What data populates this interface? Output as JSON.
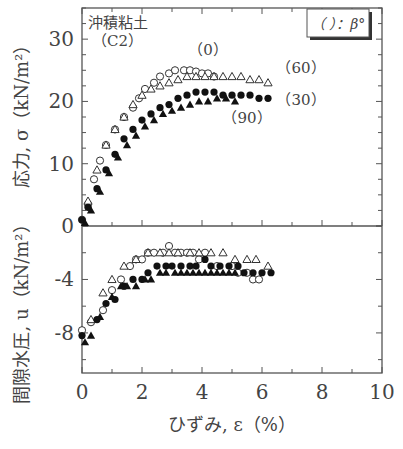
{
  "chart_data": [
    {
      "type": "scatter",
      "panel": "top",
      "title": "",
      "annotation_top_left": [
        "沖積粘土",
        "（C2）"
      ],
      "legend_box": "（ ）：β°",
      "xlabel": "ひずみ, ε（%）",
      "ylabel": "応力, σ（kN/m²）",
      "xlim": [
        0,
        10
      ],
      "ylim": [
        0,
        35
      ],
      "yticks": [
        0,
        10,
        20,
        30
      ],
      "series": [
        {
          "name": "(0)",
          "marker": "open-circle",
          "x": [
            0,
            0.2,
            0.4,
            0.6,
            0.8,
            1.1,
            1.4,
            1.7,
            1.9,
            2.1,
            2.4,
            2.6,
            2.9,
            3.1,
            3.4,
            3.6,
            3.8,
            4.0,
            4.2,
            4.4
          ],
          "y": [
            1.0,
            3.5,
            7.5,
            10.5,
            13.0,
            15.5,
            17.5,
            19.0,
            20.5,
            22.0,
            23.0,
            24.0,
            24.5,
            25.0,
            25.0,
            25.0,
            24.8,
            24.5,
            24.5,
            24.0
          ]
        },
        {
          "name": "(60)",
          "marker": "open-triangle",
          "x": [
            0.2,
            0.5,
            0.8,
            1.1,
            1.4,
            1.7,
            2.0,
            2.3,
            2.6,
            2.9,
            3.2,
            3.5,
            3.8,
            4.1,
            4.4,
            4.7,
            5.0,
            5.3,
            5.6,
            5.9,
            6.2
          ],
          "y": [
            4.0,
            9.0,
            13.0,
            15.5,
            17.5,
            19.5,
            21.0,
            22.0,
            22.5,
            23.0,
            23.5,
            24.0,
            24.0,
            24.0,
            24.0,
            24.0,
            24.0,
            24.0,
            23.5,
            23.5,
            23.0
          ]
        },
        {
          "name": "(30)",
          "marker": "filled-circle",
          "x": [
            0,
            0.2,
            0.5,
            0.8,
            1.1,
            1.4,
            1.7,
            2.0,
            2.3,
            2.6,
            2.9,
            3.2,
            3.5,
            3.8,
            4.1,
            4.4,
            4.7,
            5.0,
            5.3,
            5.6,
            5.9,
            6.2
          ],
          "y": [
            1.0,
            3.0,
            6.0,
            9.0,
            11.5,
            14.0,
            15.5,
            17.0,
            18.0,
            19.0,
            19.5,
            20.5,
            21.0,
            21.5,
            21.5,
            21.5,
            21.0,
            21.0,
            21.0,
            21.0,
            20.5,
            20.5
          ]
        },
        {
          "name": "(90)",
          "marker": "filled-triangle",
          "x": [
            0.1,
            0.3,
            0.6,
            0.9,
            1.2,
            1.5,
            1.8,
            2.1,
            2.4,
            2.7,
            3.0,
            3.3,
            3.6,
            3.9,
            4.2,
            4.5,
            4.8,
            5.1
          ],
          "y": [
            0.5,
            2.5,
            5.5,
            8.5,
            11.0,
            13.0,
            14.5,
            16.0,
            17.0,
            18.0,
            18.5,
            19.0,
            19.5,
            20.0,
            20.0,
            20.5,
            20.5,
            20.0
          ]
        }
      ],
      "series_labels": [
        {
          "text": "（0）",
          "x": 4.2,
          "y": 27.5
        },
        {
          "text": "（60）",
          "x": 7.3,
          "y": 24.5
        },
        {
          "text": "（30）",
          "x": 7.3,
          "y": 19.5
        },
        {
          "text": "（90）",
          "x": 5.5,
          "y": 16.5
        }
      ]
    },
    {
      "type": "scatter",
      "panel": "bottom",
      "xlabel": "ひずみ, ε（%）",
      "ylabel": "間隙水圧, u（kN/m²）",
      "xlim": [
        0,
        10
      ],
      "ylim": [
        -11,
        0
      ],
      "xticks": [
        0,
        2,
        4,
        6,
        8,
        10
      ],
      "yticks": [
        -8,
        -4,
        0
      ],
      "series": [
        {
          "name": "(0)",
          "marker": "open-circle",
          "x": [
            0,
            0.3,
            0.7,
            1.0,
            1.3,
            1.6,
            1.8,
            2.0,
            2.2,
            2.4,
            2.7,
            2.9,
            3.1,
            3.3,
            3.5,
            3.7,
            3.9,
            4.1,
            4.5,
            5.0,
            5.2,
            5.5,
            5.7,
            5.9
          ],
          "y": [
            -7.8,
            -7.2,
            -6.3,
            -4.8,
            -4.0,
            -3.0,
            -2.5,
            -2.5,
            -2.0,
            -2.0,
            -2.0,
            -1.5,
            -2.0,
            -2.0,
            -2.0,
            -2.0,
            -2.5,
            -2.0,
            -3.0,
            -3.0,
            -3.5,
            -3.5,
            -4.0,
            -4.0
          ]
        },
        {
          "name": "(60)",
          "marker": "open-triangle",
          "x": [
            0.3,
            0.7,
            1.0,
            1.4,
            1.8,
            2.2,
            2.6,
            2.9,
            3.2,
            3.6,
            3.9,
            4.3,
            4.7,
            5.1,
            5.5,
            5.8,
            6.2
          ],
          "y": [
            -7.0,
            -5.0,
            -4.0,
            -3.0,
            -2.5,
            -2.0,
            -2.0,
            -2.0,
            -2.0,
            -2.0,
            -2.0,
            -2.0,
            -2.0,
            -2.5,
            -2.5,
            -2.5,
            -3.0
          ]
        },
        {
          "name": "(30)",
          "marker": "filled-circle",
          "x": [
            0,
            0.5,
            0.8,
            1.1,
            1.4,
            1.7,
            2.0,
            2.2,
            2.5,
            2.8,
            3.0,
            3.3,
            3.6,
            3.8,
            4.1,
            4.3,
            4.6,
            4.9,
            5.2,
            5.4,
            5.7,
            6.0,
            6.3
          ],
          "y": [
            -8.2,
            -7.0,
            -5.8,
            -5.5,
            -4.5,
            -4.0,
            -4.0,
            -3.5,
            -3.0,
            -3.0,
            -3.0,
            -3.0,
            -3.0,
            -3.0,
            -2.5,
            -3.0,
            -3.0,
            -3.0,
            -3.0,
            -3.5,
            -3.5,
            -3.5,
            -3.5
          ]
        },
        {
          "name": "(90)",
          "marker": "filled-triangle",
          "x": [
            0.1,
            0.3,
            0.6,
            1.0,
            1.3,
            1.5,
            1.8,
            2.1,
            2.3,
            2.6,
            2.8,
            3.1,
            3.3,
            3.5,
            3.7,
            3.9,
            4.1,
            4.3,
            4.5,
            4.7,
            4.9,
            5.1
          ],
          "y": [
            -8.7,
            -8.2,
            -6.8,
            -5.3,
            -4.5,
            -4.5,
            -4.5,
            -4.0,
            -4.0,
            -3.5,
            -3.5,
            -3.5,
            -3.5,
            -3.5,
            -3.5,
            -3.5,
            -3.5,
            -3.5,
            -3.5,
            -3.5,
            -3.5,
            -3.5
          ]
        }
      ]
    }
  ],
  "labels": {
    "site": "沖積粘土",
    "sample": "（C2）",
    "legend": "（ ）：β°",
    "ylabel_top": "応力, σ（kN/m²）",
    "ylabel_bottom": "間隙水圧, u（kN/m²）",
    "xlabel": "ひずみ, ε（%）"
  }
}
